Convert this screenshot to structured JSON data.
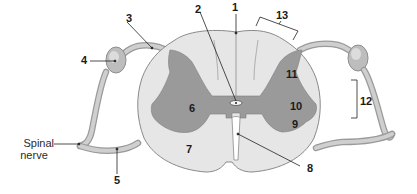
{
  "diagram": {
    "colors": {
      "white_matter": "#e6e6e6",
      "gray_matter": "#9a9a9a",
      "outline": "#8a8a8a",
      "nerve": "#c4c4c4",
      "ganglion": "#bdbdbd",
      "leader_line": "#222222",
      "background": "#ffffff"
    },
    "labels": [
      {
        "id": "1",
        "text": "1"
      },
      {
        "id": "2",
        "text": "2"
      },
      {
        "id": "3",
        "text": "3"
      },
      {
        "id": "4",
        "text": "4"
      },
      {
        "id": "5",
        "text": "5"
      },
      {
        "id": "6",
        "text": "6"
      },
      {
        "id": "7",
        "text": "7"
      },
      {
        "id": "8",
        "text": "8"
      },
      {
        "id": "9",
        "text": "9"
      },
      {
        "id": "10",
        "text": "10"
      },
      {
        "id": "11",
        "text": "11"
      },
      {
        "id": "12",
        "text": "12"
      },
      {
        "id": "13",
        "text": "13"
      }
    ],
    "spinal_nerve_label": {
      "line1": "Spinal",
      "line2": "nerve"
    }
  }
}
